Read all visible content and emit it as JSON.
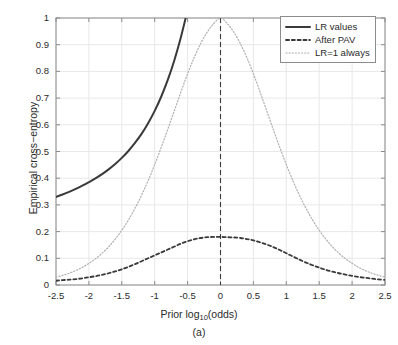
{
  "chart_data": {
    "type": "line",
    "title": "",
    "caption": "(a)",
    "xlabel": "Prior log10(odds)",
    "xlabel_parts": {
      "prefix": "Prior log",
      "subscript": "10",
      "suffix": "(odds)"
    },
    "ylabel": "Empirical cross−entropy",
    "xlim": [
      -2.5,
      2.5
    ],
    "ylim": [
      0,
      1
    ],
    "xticks": [
      -2.5,
      -2,
      -1.5,
      -1,
      -0.5,
      0,
      0.5,
      1,
      1.5,
      2,
      2.5
    ],
    "xtick_labels": [
      "-2.5",
      "-2",
      "-1.5",
      "-1",
      "-0.5",
      "0",
      "0.5",
      "1",
      "1.5",
      "2",
      "2.5"
    ],
    "yticks": [
      0,
      0.1,
      0.2,
      0.3,
      0.4,
      0.5,
      0.6,
      0.7,
      0.8,
      0.9,
      1
    ],
    "ytick_labels": [
      "0",
      "0.1",
      "0.2",
      "0.3",
      "0.4",
      "0.5",
      "0.6",
      "0.7",
      "0.8",
      "0.9",
      "1"
    ],
    "grid": true,
    "grid_color": "#e8e8e8",
    "axis_color": "#8c8c8c",
    "legend_position": "top-right",
    "reference_line": {
      "type": "vertical",
      "x": 0,
      "style": "dashed",
      "color": "#3a3a3a"
    },
    "x": [
      -2.5,
      -2.4,
      -2.3,
      -2.2,
      -2.1,
      -2.0,
      -1.9,
      -1.8,
      -1.7,
      -1.6,
      -1.5,
      -1.4,
      -1.3,
      -1.2,
      -1.1,
      -1.0,
      -0.9,
      -0.8,
      -0.7,
      -0.6,
      -0.5,
      -0.4,
      -0.3,
      -0.2,
      -0.1,
      0.0,
      0.1,
      0.2,
      0.3,
      0.4,
      0.5,
      0.6,
      0.7,
      0.8,
      0.9,
      1.0,
      1.1,
      1.2,
      1.3,
      1.4,
      1.5,
      1.6,
      1.7,
      1.8,
      1.9,
      2.0,
      2.1,
      2.2,
      2.3,
      2.4,
      2.5
    ],
    "series": [
      {
        "name": "LR values",
        "style": "solid",
        "color": "#3a3a3a",
        "width": 2.0,
        "clipped_at_top": true,
        "exit_x": -0.32,
        "values": [
          0.33,
          0.339,
          0.349,
          0.36,
          0.372,
          0.385,
          0.399,
          0.415,
          0.433,
          0.453,
          0.476,
          0.502,
          0.532,
          0.566,
          0.606,
          0.652,
          0.706,
          0.769,
          0.843,
          0.93,
          1.03,
          null,
          null,
          null,
          null,
          null,
          null,
          null,
          null,
          null,
          null,
          null,
          null,
          null,
          null,
          null,
          null,
          null,
          null,
          null,
          null,
          null,
          null,
          null,
          null,
          null,
          null,
          null,
          null,
          null,
          null
        ]
      },
      {
        "name": "After PAV",
        "style": "dashed",
        "color": "#3a3a3a",
        "width": 1.8,
        "values": [
          0.016,
          0.018,
          0.02,
          0.022,
          0.025,
          0.029,
          0.033,
          0.038,
          0.044,
          0.051,
          0.059,
          0.068,
          0.078,
          0.089,
          0.1,
          0.111,
          0.122,
          0.133,
          0.144,
          0.155,
          0.164,
          0.171,
          0.176,
          0.179,
          0.18,
          0.18,
          0.179,
          0.178,
          0.176,
          0.172,
          0.167,
          0.16,
          0.152,
          0.142,
          0.131,
          0.119,
          0.107,
          0.095,
          0.084,
          0.074,
          0.065,
          0.057,
          0.05,
          0.044,
          0.039,
          0.034,
          0.03,
          0.027,
          0.024,
          0.021,
          0.019
        ]
      },
      {
        "name": "LR=1 always",
        "style": "dotted",
        "color": "#b0b0b0",
        "width": 1.2,
        "values": [
          0.029,
          0.036,
          0.044,
          0.054,
          0.066,
          0.081,
          0.098,
          0.119,
          0.143,
          0.172,
          0.205,
          0.243,
          0.287,
          0.336,
          0.391,
          0.451,
          0.516,
          0.584,
          0.654,
          0.724,
          0.791,
          0.852,
          0.905,
          0.948,
          0.98,
          1.0,
          0.98,
          0.948,
          0.905,
          0.852,
          0.791,
          0.724,
          0.654,
          0.584,
          0.516,
          0.451,
          0.391,
          0.336,
          0.287,
          0.243,
          0.205,
          0.172,
          0.143,
          0.119,
          0.098,
          0.081,
          0.066,
          0.054,
          0.044,
          0.036,
          0.029
        ]
      }
    ]
  },
  "legend": {
    "items": [
      {
        "label": "LR values"
      },
      {
        "label": "After PAV"
      },
      {
        "label": "LR=1 always"
      }
    ]
  }
}
